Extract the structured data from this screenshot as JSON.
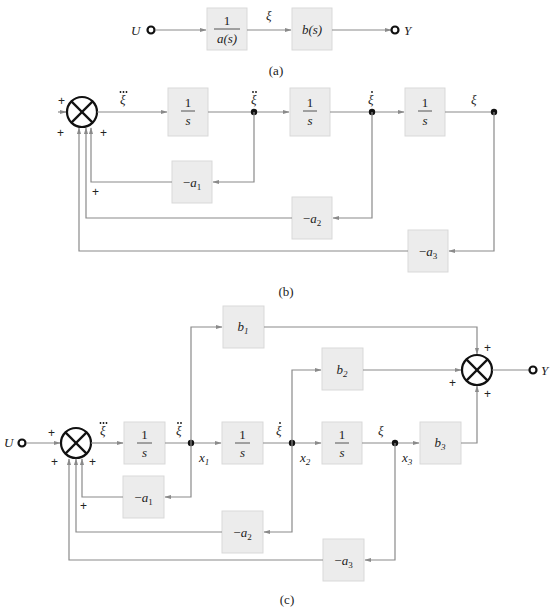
{
  "panels": {
    "a": {
      "caption": "(a)",
      "input": "U",
      "output": "Y",
      "block1": {
        "num": "1",
        "den": "a(s)"
      },
      "signal": "ξ",
      "block2": "b(s)"
    },
    "b": {
      "caption": "(b)",
      "integrator": {
        "num": "1",
        "den": "s"
      },
      "signals": {
        "xi3": "ξ",
        "xi2": "ξ",
        "xi1": "ξ",
        "xi0": "ξ"
      },
      "feedback": [
        {
          "minus": "−",
          "var": "a",
          "sub": "1"
        },
        {
          "minus": "−",
          "var": "a",
          "sub": "2"
        },
        {
          "minus": "−",
          "var": "a",
          "sub": "3"
        }
      ],
      "signs": {
        "top": "+",
        "left": "+",
        "right": "+",
        "inner": "+"
      }
    },
    "c": {
      "caption": "(c)",
      "input": "U",
      "output": "Y",
      "integrator": {
        "num": "1",
        "den": "s"
      },
      "signals": {
        "xi3": "ξ",
        "xi2": "ξ",
        "xi1": "ξ",
        "xi0": "ξ"
      },
      "states": [
        {
          "var": "x",
          "sub": "1"
        },
        {
          "var": "x",
          "sub": "2"
        },
        {
          "var": "x",
          "sub": "3"
        }
      ],
      "forward": [
        {
          "var": "b",
          "sub": "1"
        },
        {
          "var": "b",
          "sub": "2"
        },
        {
          "var": "b",
          "sub": "3"
        }
      ],
      "feedback": [
        {
          "minus": "−",
          "var": "a",
          "sub": "1"
        },
        {
          "minus": "−",
          "var": "a",
          "sub": "2"
        },
        {
          "minus": "−",
          "var": "a",
          "sub": "3"
        }
      ],
      "signs": {
        "top": "+",
        "left": "+",
        "right": "+",
        "inner": "+",
        "out_top": "+",
        "out_left": "+",
        "out_bottom": "+"
      }
    }
  }
}
